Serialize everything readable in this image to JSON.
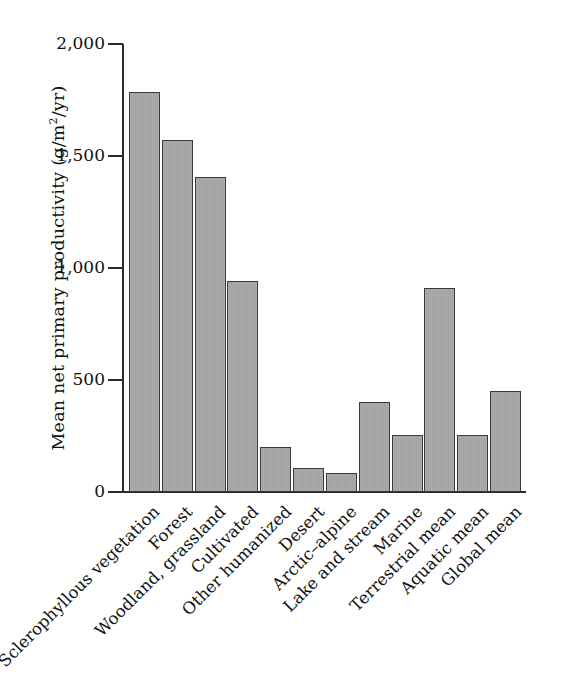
{
  "chart_data": {
    "type": "bar",
    "title": "",
    "xlabel": "",
    "ylabel": "Mean net primary productivity (g/m2/yr)",
    "ylabel_parts": {
      "pre": "Mean net primary productivity (g/m",
      "sup": "2",
      "post": "/yr)"
    },
    "ylim": [
      0,
      2000
    ],
    "yticks": [
      0,
      500,
      1000,
      1500,
      2000
    ],
    "ytick_labels": [
      "0",
      "500",
      "1,000",
      "1,500",
      "2,000"
    ],
    "grid": false,
    "legend": null,
    "bar_color": "#a6a6a6",
    "bar_edge_color": "#3a3a3a",
    "categories": [
      "Sclerophyllous vegetation",
      "Forest",
      "Woodland, grassland",
      "Cultivated",
      "Other humanized",
      "Desert",
      "Arctic–alpine",
      "Lake and stream",
      "Marine",
      "Terrestrial mean",
      "Aquatic mean",
      "Global mean"
    ],
    "values": [
      1785,
      1570,
      1405,
      940,
      200,
      105,
      85,
      400,
      255,
      910,
      255,
      450
    ]
  }
}
